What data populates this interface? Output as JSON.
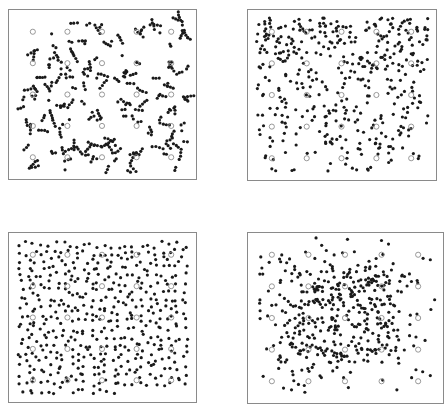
{
  "figure": {
    "layout": "2x2",
    "colors": {
      "dot": "#1a1a1a",
      "ring": "#8c8c8c",
      "frame": "#8a8a8a",
      "background": "#ffffff"
    },
    "grid_markers": {
      "rows": 5,
      "cols": 5,
      "marker": "open-circle"
    },
    "panels": [
      {
        "id": "top-left",
        "x": 8,
        "y": 9,
        "w": 189,
        "h": 171,
        "dot_count": 420,
        "pattern": "clustered-chains",
        "seed": 11
      },
      {
        "id": "top-right",
        "x": 247,
        "y": 9,
        "w": 190,
        "h": 172,
        "dot_count": 420,
        "pattern": "dense-top-sparse-bottom",
        "seed": 23
      },
      {
        "id": "bottom-left",
        "x": 8,
        "y": 232,
        "w": 189,
        "h": 171,
        "dot_count": 470,
        "pattern": "uniform-regular",
        "seed": 37
      },
      {
        "id": "bottom-right",
        "x": 247,
        "y": 232,
        "w": 197,
        "h": 172,
        "dot_count": 430,
        "pattern": "center-clumped",
        "seed": 53
      }
    ]
  }
}
